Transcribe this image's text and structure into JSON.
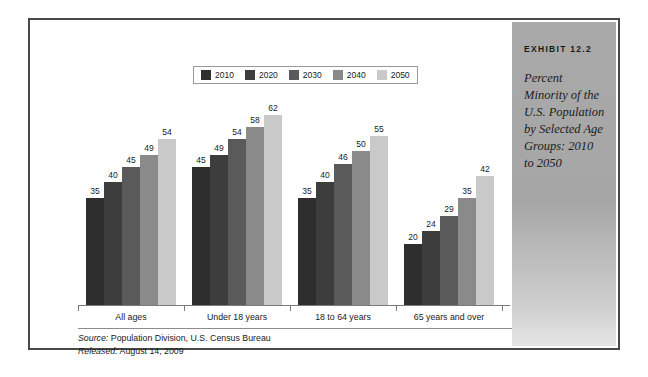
{
  "exhibit": {
    "label": "EXHIBIT 12.2",
    "title": "Percent Minority of the U.S. Population by Selected Age Groups: 2010 to 2050"
  },
  "source": {
    "source_prefix": "Source:",
    "source_text": " Population Division, U.S. Census Bureau",
    "released_prefix": "Released:",
    "released_text": " August 14, 2009"
  },
  "colors": {
    "series": [
      "#2e2e2e",
      "#3d3d3d",
      "#5a5a5a",
      "#8a8a8a",
      "#c9c9c9"
    ],
    "frame": "#4a4a4a",
    "panel": "#a9a9a9",
    "axis": "#7a7a7a"
  },
  "chart_data": {
    "type": "bar",
    "title": "Percent Minority of the U.S. Population by Selected Age Groups: 2010 to 2050",
    "xlabel": "",
    "ylabel": "",
    "ylim": [
      0,
      70
    ],
    "grid": false,
    "legend_position": "top-center",
    "categories": [
      "All ages",
      "Under 18 years",
      "18 to 64 years",
      "65 years and over"
    ],
    "series": [
      {
        "name": "2010",
        "color": "#2e2e2e",
        "values": [
          35,
          45,
          35,
          20
        ]
      },
      {
        "name": "2020",
        "color": "#3d3d3d",
        "values": [
          40,
          49,
          40,
          24
        ]
      },
      {
        "name": "2030",
        "color": "#5a5a5a",
        "values": [
          45,
          54,
          46,
          29
        ]
      },
      {
        "name": "2040",
        "color": "#8a8a8a",
        "values": [
          49,
          58,
          50,
          35
        ]
      },
      {
        "name": "2050",
        "color": "#c9c9c9",
        "values": [
          54,
          62,
          55,
          42
        ]
      }
    ]
  }
}
